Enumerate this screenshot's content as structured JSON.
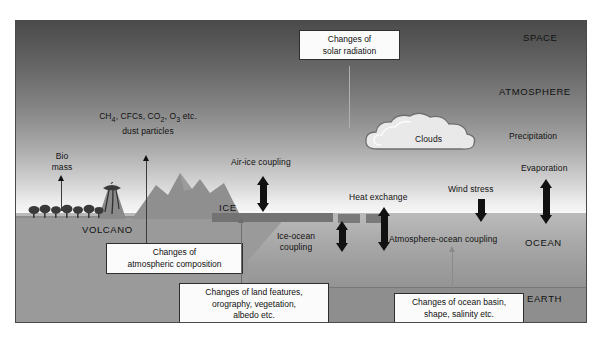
{
  "figure": {
    "zones": [
      {
        "name": "space",
        "label": "SPACE"
      },
      {
        "name": "atmosphere",
        "label": "ATMOSPHERE"
      },
      {
        "name": "ocean",
        "label": "OCEAN"
      },
      {
        "name": "earth",
        "label": "EARTH"
      }
    ],
    "features": [
      {
        "name": "greenhouse-gases",
        "line1": "CH",
        "sub1": "4",
        "line1b": ", CFCs, CO",
        "sub2": "2",
        "line1c": ", O",
        "sub3": "3",
        "line1d": " etc.",
        "line2": "dust particles"
      },
      {
        "name": "clouds",
        "label": "Clouds"
      },
      {
        "name": "bio-mass",
        "line1": "Bio",
        "line2": "mass"
      },
      {
        "name": "volcano",
        "label": "VOLCANO"
      },
      {
        "name": "ice",
        "label": "ICE"
      }
    ],
    "processes": [
      {
        "name": "air-ice-coupling",
        "label": "Air-ice coupling",
        "arrow": "double-vertical"
      },
      {
        "name": "ice-ocean-coupling",
        "line1": "Ice-ocean",
        "line2": "coupling",
        "arrow": "double-vertical"
      },
      {
        "name": "heat-exchange",
        "label": "Heat exchange",
        "arrow": "double-vertical"
      },
      {
        "name": "wind-stress",
        "label": "Wind stress",
        "arrow": "down"
      },
      {
        "name": "evaporation",
        "label": "Evaporation",
        "arrow": "double-vertical"
      },
      {
        "name": "precipitation",
        "label": "Precipitation",
        "arrow": "none"
      },
      {
        "name": "atmosphere-ocean-coupling",
        "label": "Atmosphere-ocean coupling",
        "arrow": "none"
      }
    ],
    "callouts": [
      {
        "name": "solar-radiation",
        "line1": "Changes of",
        "line2": "solar radiation"
      },
      {
        "name": "atmospheric-composition",
        "line1": "Changes of",
        "line2": "atmospheric composition"
      },
      {
        "name": "land-features",
        "line1": "Changes of land features,",
        "line2": "orography, vegetation,",
        "line3": "albedo etc."
      },
      {
        "name": "ocean-basin",
        "line1": "Changes of ocean basin,",
        "line2": "shape, salinity etc."
      }
    ],
    "colors": {
      "space_dark": "#4b4b4b",
      "atmosphere_light": "#f8f8f8",
      "ocean": "#a9a9a9",
      "land": "#9a9a9a",
      "earth_deep": "#8e8e8e",
      "ice": "#737373",
      "arrow": "#111111",
      "callout_bg": "#fbfbfb",
      "callout_border": "#2e2e2e"
    }
  }
}
